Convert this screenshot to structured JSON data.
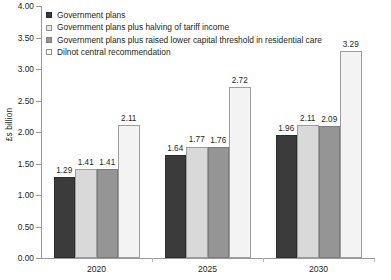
{
  "chart_data": {
    "type": "bar",
    "title": "",
    "xlabel": "",
    "ylabel": "£s billion",
    "ylim": [
      0,
      4.0
    ],
    "ytick_step": 0.5,
    "grid": false,
    "legend_position": "top-left",
    "categories": [
      "2020",
      "2025",
      "2030"
    ],
    "ytick_labels": [
      "4.00",
      "3.50",
      "3.00",
      "2.50",
      "2.00",
      "1.50",
      "1.00",
      "0.50",
      "0.00"
    ],
    "ytick_values": [
      4.0,
      3.5,
      3.0,
      2.5,
      2.0,
      1.5,
      1.0,
      0.5,
      0.0
    ],
    "series": [
      {
        "name": "Government plans",
        "color": "#3b3b3b",
        "values": [
          1.29,
          1.64,
          1.96
        ],
        "labels": [
          "1.29",
          "1.64",
          "1.96"
        ]
      },
      {
        "name": "Government plans plus halving of tariff income",
        "color": "#d9d9d9",
        "values": [
          1.41,
          1.77,
          2.11
        ],
        "labels": [
          "1.41",
          "1.77",
          "2.11"
        ]
      },
      {
        "name": "Government plans plus raised lower capital threshold in residential care",
        "color": "#959595",
        "values": [
          1.41,
          1.76,
          2.09
        ],
        "labels": [
          "1.41",
          "1.76",
          "2.09"
        ]
      },
      {
        "name": "Dilnot central recommendation",
        "color": "#f3f3f3",
        "values": [
          2.11,
          2.72,
          3.29
        ],
        "labels": [
          "2.11",
          "2.72",
          "3.29"
        ]
      }
    ]
  },
  "legend": {
    "items": [
      {
        "label": "Government plans"
      },
      {
        "label": "Government plans plus halving of tariff income"
      },
      {
        "label": "Government plans plus raised lower capital threshold in residential care"
      },
      {
        "label": "Dilnot central recommendation"
      }
    ]
  },
  "axes": {
    "y_title": "£s billion"
  },
  "caption": {
    "text": ""
  }
}
